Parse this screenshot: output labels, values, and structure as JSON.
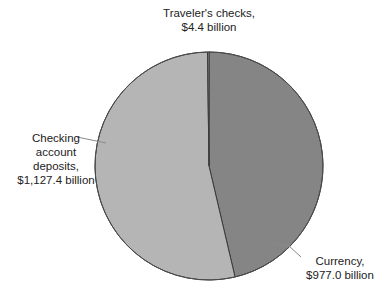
{
  "chart_data": {
    "type": "pie",
    "title": "",
    "unit": "billion",
    "slices": [
      {
        "name": "Currency",
        "value": 977.0,
        "label_lines": [
          "Currency,",
          "$977.0 billion"
        ],
        "color": "#858585"
      },
      {
        "name": "Checking account deposits",
        "value": 1127.4,
        "label_lines": [
          "Checking",
          "account",
          "deposits,",
          "$1,127.4 billion"
        ],
        "color": "#b5b5b5"
      },
      {
        "name": "Traveler's checks",
        "value": 4.4,
        "label_lines": [
          "Traveler's checks,",
          "$4.4 billion"
        ],
        "color": "#9a9a9a"
      }
    ],
    "start_angle_deg": 0,
    "direction": "clockwise",
    "legend": "none (direct labels with leader lines)"
  },
  "labels": {
    "travelers": {
      "line1": "Traveler's checks,",
      "line2": "$4.4 billion"
    },
    "checking": {
      "line1": "Checking",
      "line2": "account",
      "line3": "deposits,",
      "line4": "$1,127.4 billion"
    },
    "currency": {
      "line1": "Currency,",
      "line2": "$977.0 billion"
    }
  },
  "colors": {
    "currency": "#858585",
    "checking": "#b5b5b5",
    "travelers": "#9a9a9a",
    "outline": "#4a4a4a",
    "leader": "#8a8a8a"
  }
}
